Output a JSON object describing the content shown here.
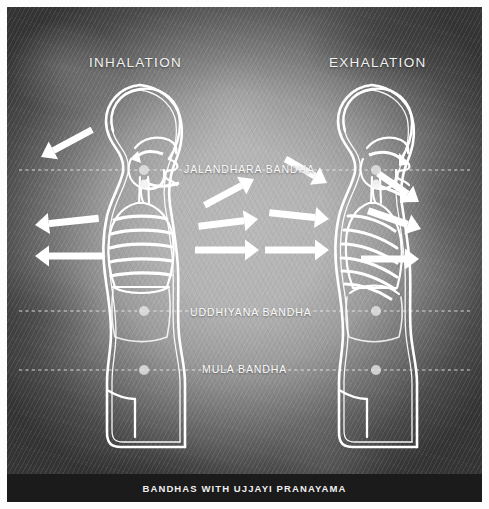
{
  "poster": {
    "width": 489,
    "height": 509,
    "frame_color": "#fdfdfd",
    "background_style": "dark-grey vignette with diagonal weave texture",
    "line_color": "#ffffff"
  },
  "headings": {
    "left": "INHALATION",
    "right": "EXHALATION"
  },
  "bandha_lines": [
    {
      "id": "jalandhara",
      "label": "JALANDHARA BANDHA",
      "y": 170,
      "marker_label": "bandha-point-marker",
      "description": "throat lock at the level of the larynx"
    },
    {
      "id": "uddhiyana",
      "label": "UDDHIYANA BANDHA",
      "y": 311,
      "marker_label": "bandha-point-marker",
      "description": "abdominal lock below the ribcage"
    },
    {
      "id": "mula",
      "label": "MULA BANDHA",
      "y": 370,
      "marker_label": "bandha-point-marker",
      "description": "root lock at the pelvic floor"
    }
  ],
  "figures": [
    {
      "id": "inhalation",
      "side": "left",
      "heading": "INHALATION",
      "airflow_direction": "in",
      "ribcage_ribs": 5,
      "ribcage_state": "expanded, ribs lifted",
      "arrow_count": 6,
      "arrow_direction": "outward",
      "diaphragm_state": "descended"
    },
    {
      "id": "exhalation",
      "side": "right",
      "heading": "EXHALATION",
      "airflow_direction": "out",
      "ribcage_ribs": 6,
      "ribcage_state": "contracted, ribs angled down",
      "arrow_count": 6,
      "arrow_direction": "inward",
      "diaphragm_state": "raised"
    }
  ],
  "caption": {
    "text": "BANDHAS WITH UJJAYI PRANAYAMA",
    "bar_color": "#1b1b1b"
  }
}
